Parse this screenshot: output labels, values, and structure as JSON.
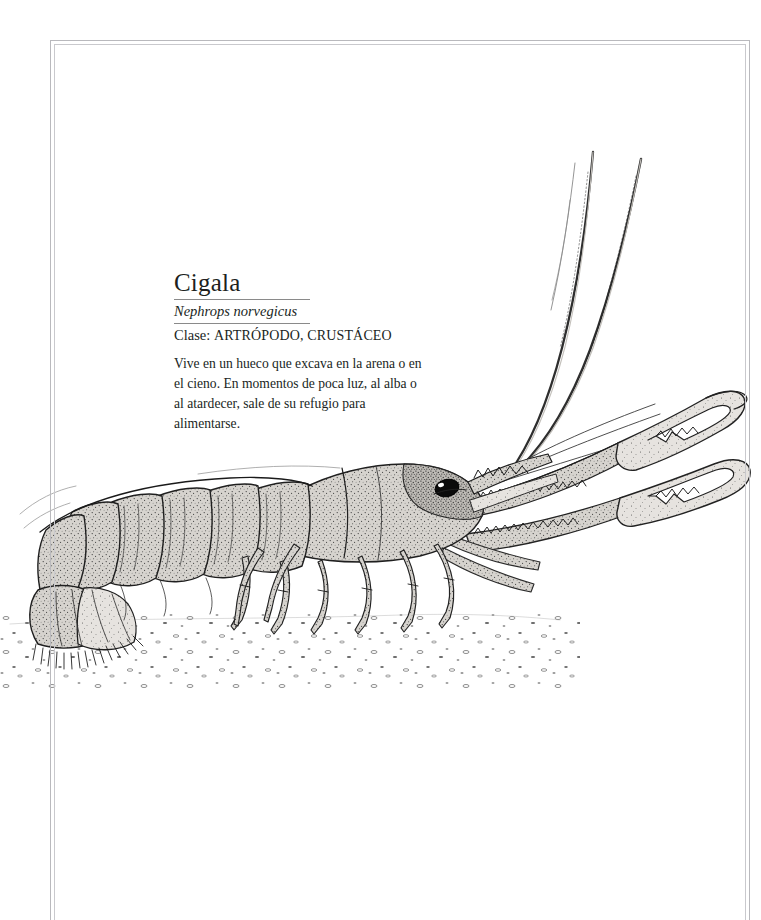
{
  "page": {
    "background_color": "#ffffff",
    "frame_color": "#b9b9bd",
    "text_color": "#201f1d"
  },
  "caption": {
    "common_name": "Cigala",
    "scientific_name": "Nephrops norvegicus",
    "class_label": "Clase: ",
    "class_value": "ARTRÓPODO, CRUSTÁCEO",
    "description": "Vive en un hueco que excava en la arena o en el cieno. En momentos de poca luz, al alba o al atardecer, sale de su refugio para alimentarse."
  },
  "illustration": {
    "subject": "norway-lobster",
    "technique": "pen-and-ink stipple engraving",
    "ink_color": "#2b2b2b",
    "shell_fill": "#c9c6c1",
    "shell_fill_light": "#dedbd6",
    "eye_color": "#0d0d0d",
    "parts": [
      "antenna-long-left",
      "antenna-long-right",
      "antennule",
      "rostrum",
      "eye",
      "carapace",
      "abdomen-segments",
      "tail-fan",
      "uropods",
      "cheliped-claw-upper",
      "cheliped-claw-lower",
      "walking-legs",
      "seabed-sand"
    ]
  }
}
